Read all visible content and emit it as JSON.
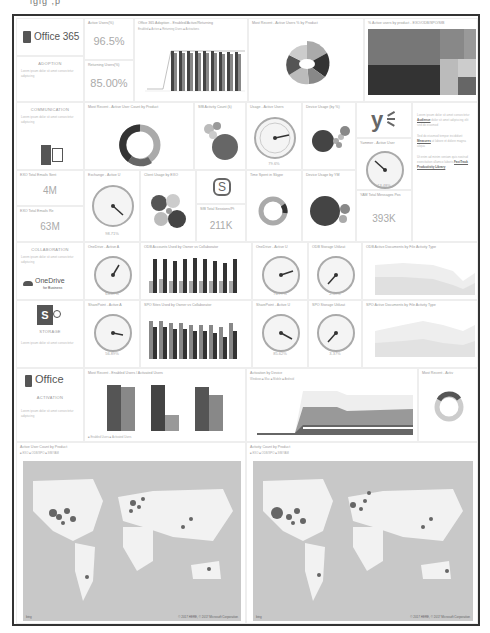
{
  "page_header_clip": "igig ,p",
  "adoption": {
    "logo": "Office 365",
    "section": "ADOPTION",
    "desc": "Lorem ipsum dolor sit amet consectetur adipiscing",
    "active_users_title": "Active Users(%)",
    "active_users_value": "96.5%",
    "returning_users_title": "Returning Users(%)",
    "returning_users_value": "85.00%",
    "enabled_chart_title": "Office 365 Adoption - Enabled/Active/Returning",
    "enabled_chart_legend": "Enabled ■ Active ■ Returning Users ■ Activations",
    "most_recent_pie_title": "Most Recent - Active Users % by Product",
    "treemap_title": "% Active users by product - EXO/ODB/SPO/SfB"
  },
  "communication": {
    "section": "COMMUNICATION",
    "desc": "Lorem ipsum dolor sit amet consectetur adipiscing",
    "donut_title": "Most Recent - Active User Count by Product",
    "sfb_activity_title": "SfB Activity Count (k)",
    "usage_gauge_title": "Usage - Active Users",
    "usage_gauge_value": "79.6%",
    "device_usage_title": "Device Usage (by %)",
    "device_bubble_main": "Windows",
    "yammer_gauge_title": "Yammer - Active User",
    "yammer_gauge_value": "13.48%",
    "emails_sent_title": "EXO Total Emails Sent",
    "emails_sent_value": "4M",
    "emails_received_title": "EXO Total Emails Re",
    "emails_received_value": "63M",
    "exchange_gauge_title": "Exchange - Active U",
    "exchange_gauge_value": "98.71%",
    "client_usage_title": "Client Usage by EXO",
    "client_bubble_main": "Outlook",
    "sfb_sessions_title": "SfB Total Sessions/Pt",
    "sfb_sessions_value": "211K",
    "time_spent_title": "Time Spent in Skype",
    "device_usage_yam_title": "Device Usage by YM",
    "device_bubble_web": "Web",
    "yammer_messages_title": "YAM Total Messages Pos",
    "yammer_messages_value": "393K"
  },
  "notes": {
    "p1": "Lorem ipsum dolor sit amet consectetur",
    "link1": "Audience",
    "p1b": "dolor sit amet adipiscing elit sed do eiusmod",
    "p2": "Sed do eiusmod tempor incididunt",
    "link2": "Measures",
    "p2b": "ut labore et dolore magna aliqua",
    "p3": "Ut enim ad minim veniam quis nostrud exercitation ullamco laboris",
    "link3": "FastTrack Productivity Library"
  },
  "collaboration": {
    "section": "COLLABORATION",
    "desc": "Lorem ipsum dolor sit amet consectetur adipiscing",
    "logo": "OneDrive",
    "logo_sub": "for Business",
    "onedrive_gauge_title": "OneDrive - Active A",
    "onedrive_gauge_value": "63.87%",
    "odb_accounts_title": "ODB Accounts Used by Owner vs Collaborator",
    "odb_gauge_title": "OneDrive - Active U",
    "odb_gauge_value": "76.77%",
    "odb_storage_title": "ODB Storage Utilizat",
    "odb_storage_value": "2.59%",
    "odb_docs_title": "ODB Active Documents by File Activity Type",
    "sp_section": "STORAGE",
    "sp_desc": "Lorem ipsum dolor sit amet consectetur",
    "sp_gauge_title": "SharePoint - Active A",
    "sp_gauge_value": "56.89%",
    "spo_sites_title": "SPO Sites Used by Owner vs Collaborator",
    "sp_gauge2_title": "SharePoint - Active U",
    "sp_gauge2_value": "85.62%",
    "spo_storage_title": "SPO Storage Utilizat",
    "spo_storage_value": "3.37%",
    "spo_docs_title": "SPO Active Documents by File Activity Type"
  },
  "activation": {
    "logo": "Office",
    "section": "ACTIVATION",
    "desc": "Lorem ipsum dolor sit amet consectetur adipiscing",
    "bar_title": "Most Recent - Enabled Users / Activated Users",
    "bar_legend": "■ Enabled Users ■ Activated Users",
    "device_title": "Activation by Device",
    "device_legend": "Windows ■ Mac ■ Mobile ■ Android",
    "recent_title": "Most Recent - Activ"
  },
  "maps": {
    "active_title": "Active User Count by Product",
    "activity_title": "Activity Count by Product",
    "legend": "■ EXO ■ ODB/SPO ■ SfB/YAM",
    "attribution": "© 2017 HERE, © 2017 Microsoft Corporation",
    "brand": "bing",
    "labels": [
      "USA",
      "EUROPE",
      "ASIA",
      "AFRICA",
      "SOUTH AMERICA",
      "AUSTRALIA"
    ]
  }
}
